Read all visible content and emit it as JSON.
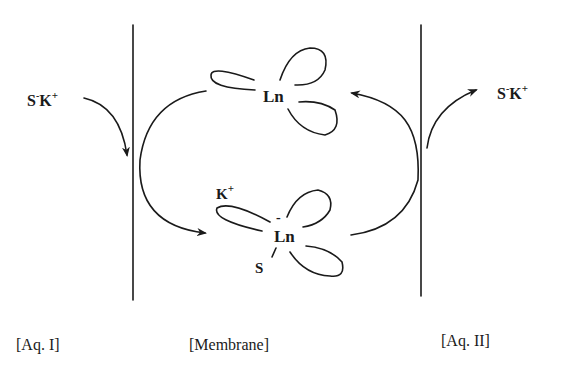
{
  "diagram": {
    "type": "membrane-transport-cycle",
    "compartments": [
      {
        "id": "aq1",
        "label": "[Aq. I]"
      },
      {
        "id": "membrane",
        "label": "[Membrane]"
      },
      {
        "id": "aq2",
        "label": "[Aq. II]"
      }
    ],
    "species": {
      "left_salt": {
        "base": "S",
        "charge1": "-",
        "cation": "K",
        "charge2": "+"
      },
      "right_salt": {
        "base": "S",
        "charge1": "-",
        "cation": "K",
        "charge2": "+"
      },
      "free_carrier": {
        "label": "Ln"
      },
      "complex": {
        "metal": "Ln",
        "charge": "-",
        "cation": "K",
        "cation_charge": "+",
        "anion": "S"
      }
    },
    "arrows": [
      {
        "from": "S⁻K⁺ (Aq. I)",
        "to": "membrane interface I"
      },
      {
        "from": "free Ln",
        "to": "complex (via interface I)"
      },
      {
        "from": "complex",
        "to": "free Ln (via interface II)"
      },
      {
        "from": "membrane interface II",
        "to": "S⁻K⁺ (Aq. II)"
      }
    ],
    "colors": {
      "ink": "#1a1a1a",
      "background": "#ffffff"
    }
  }
}
